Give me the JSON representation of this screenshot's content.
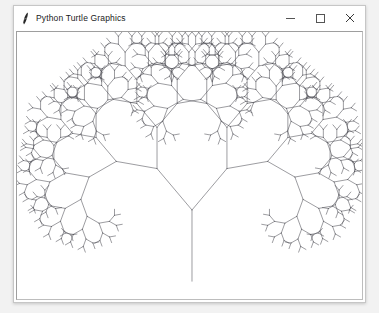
{
  "window": {
    "title": "Python Turtle Graphics",
    "icon": "python-turtle-icon",
    "controls": {
      "minimize_label": "─",
      "maximize_label": "□",
      "close_label": "×",
      "minimize_name": "minimize-button",
      "maximize_name": "maximize-button",
      "close_name": "close-button"
    }
  },
  "canvas": {
    "name": "turtle-drawing-canvas",
    "background_color": "#ffffff",
    "line_color": "#4a4a52",
    "line_width": 0.55,
    "width": 347,
    "height": 270,
    "drawing": {
      "type": "fractal-tree",
      "description": "Recursive binary fractal tree drawn with Python turtle graphics",
      "trunk_base_x": 176,
      "trunk_base_y": 252,
      "trunk_length": 72,
      "branch_angle_degrees": 40,
      "scale_factor": 0.76,
      "recursion_depth": 9,
      "initial_heading_degrees": -90
    }
  }
}
